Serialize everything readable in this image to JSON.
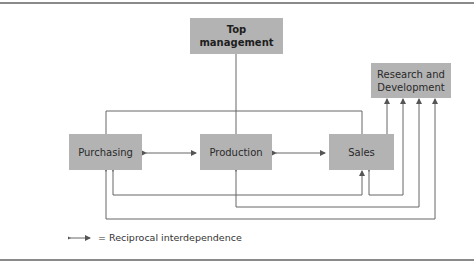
{
  "diagram": {
    "nodes": {
      "top_management": "Top\nmanagement",
      "research_development": "Research and\nDevelopment",
      "purchasing": "Purchasing",
      "production": "Production",
      "sales": "Sales"
    },
    "edges": [
      {
        "from": "top_management",
        "to": [
          "purchasing",
          "production",
          "sales"
        ],
        "type": "hierarchy"
      },
      {
        "from": "purchasing",
        "to": "production",
        "type": "reciprocal"
      },
      {
        "from": "production",
        "to": "sales",
        "type": "reciprocal"
      },
      {
        "from": "sales",
        "to": "research_development",
        "type": "arrow"
      },
      {
        "from": "sales",
        "to": "purchasing",
        "type": "reciprocal"
      },
      {
        "from": "research_development",
        "to": "sales",
        "type": "reciprocal"
      },
      {
        "from": "research_development",
        "to": "production",
        "type": "reciprocal"
      },
      {
        "from": "research_development",
        "to": "purchasing",
        "type": "reciprocal"
      }
    ],
    "legend": {
      "symbol": "double-arrow",
      "label": "= Reciprocal interdependence"
    }
  }
}
